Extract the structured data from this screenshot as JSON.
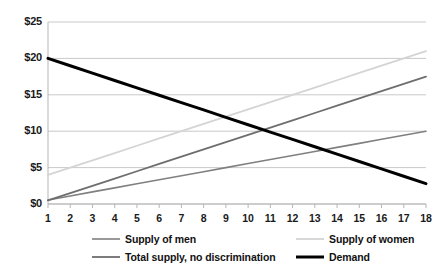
{
  "chart_data": {
    "type": "line",
    "title": "",
    "xlabel": "",
    "ylabel": "",
    "x": [
      1,
      2,
      3,
      4,
      5,
      6,
      7,
      8,
      9,
      10,
      11,
      12,
      13,
      14,
      15,
      16,
      17,
      18
    ],
    "xtick_labels": [
      "1",
      "2",
      "3",
      "4",
      "5",
      "6",
      "7",
      "8",
      "9",
      "10",
      "11",
      "12",
      "13",
      "14",
      "15",
      "16",
      "17",
      "18"
    ],
    "ytick_labels": [
      "$0",
      "$5",
      "$10",
      "$15",
      "$20",
      "$25"
    ],
    "ytick_values": [
      0,
      5,
      10,
      15,
      20,
      25
    ],
    "ylim": [
      0,
      25
    ],
    "grid": true,
    "legend_position": "bottom",
    "series": [
      {
        "name": "Supply of men",
        "color": "#808080",
        "width": 1.6,
        "values": [
          0.55,
          1.11,
          1.67,
          2.22,
          2.78,
          3.33,
          3.89,
          4.44,
          5.0,
          5.56,
          6.11,
          6.67,
          7.22,
          7.78,
          8.33,
          8.89,
          9.44,
          10.0
        ]
      },
      {
        "name": "Supply of women",
        "color": "#d4d4d4",
        "width": 1.8,
        "values": [
          4.0,
          5.0,
          6.0,
          7.0,
          8.0,
          9.0,
          10.0,
          11.0,
          12.0,
          13.0,
          14.0,
          15.0,
          16.0,
          17.0,
          18.0,
          19.0,
          20.0,
          21.0
        ]
      },
      {
        "name": "Total supply, no discrimination",
        "color": "#6e6e6e",
        "width": 1.8,
        "values": [
          0.5,
          1.5,
          2.5,
          3.5,
          4.5,
          5.5,
          6.5,
          7.5,
          8.5,
          9.5,
          10.5,
          11.5,
          12.5,
          13.5,
          14.5,
          15.5,
          16.5,
          17.5
        ]
      },
      {
        "name": "Demand",
        "color": "#000000",
        "width": 3.0,
        "values": [
          20.0,
          18.99,
          17.98,
          16.96,
          15.95,
          14.94,
          13.93,
          12.92,
          11.91,
          10.89,
          9.88,
          8.87,
          7.86,
          6.85,
          5.84,
          4.82,
          3.81,
          2.8
        ]
      }
    ]
  },
  "legend": {
    "items": [
      {
        "label": "Supply of men"
      },
      {
        "label": "Supply of women"
      },
      {
        "label": "Total supply, no discrimination"
      },
      {
        "label": "Demand"
      }
    ]
  }
}
